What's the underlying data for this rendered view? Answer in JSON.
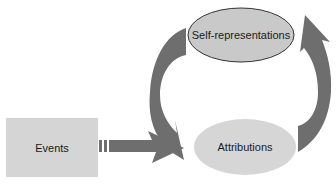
{
  "diagram": {
    "type": "flow-cycle",
    "nodes": {
      "events": {
        "label": "Events",
        "shape": "rectangle",
        "fill": "#d5d5d5"
      },
      "self_representations": {
        "label": "Self-representations",
        "shape": "ellipse",
        "fill": "#c9c9c9",
        "stroke": "#333333"
      },
      "attributions": {
        "label": "Attributions",
        "shape": "ellipse",
        "fill": "#d6d6d6"
      }
    },
    "edges": [
      {
        "from": "Events",
        "to": "Attributions",
        "style": "striped-block-arrow"
      },
      {
        "from": "Attributions",
        "to": "Self-representations",
        "style": "curved-block-arrow"
      },
      {
        "from": "Self-representations",
        "to": "Attributions",
        "style": "curved-block-arrow"
      }
    ],
    "arrow_color": "#6e6e6e"
  }
}
